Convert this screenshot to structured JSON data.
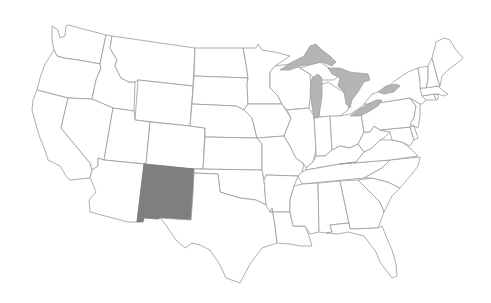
{
  "map": {
    "title": "United States",
    "highlighted_state": "New Mexico",
    "colors": {
      "background": "#ffffff",
      "state_fill": "#ffffff",
      "state_border": "#9a9a9a",
      "highlight_fill": "#7f7f7f",
      "lake_fill": "#b5b5b5"
    },
    "states": [
      {
        "name": "Washington",
        "highlighted": false
      },
      {
        "name": "Oregon",
        "highlighted": false
      },
      {
        "name": "California",
        "highlighted": false
      },
      {
        "name": "Idaho",
        "highlighted": false
      },
      {
        "name": "Nevada",
        "highlighted": false
      },
      {
        "name": "Montana",
        "highlighted": false
      },
      {
        "name": "Wyoming",
        "highlighted": false
      },
      {
        "name": "Utah",
        "highlighted": false
      },
      {
        "name": "Arizona",
        "highlighted": false
      },
      {
        "name": "Colorado",
        "highlighted": false
      },
      {
        "name": "New Mexico",
        "highlighted": true
      },
      {
        "name": "North Dakota",
        "highlighted": false
      },
      {
        "name": "South Dakota",
        "highlighted": false
      },
      {
        "name": "Nebraska",
        "highlighted": false
      },
      {
        "name": "Kansas",
        "highlighted": false
      },
      {
        "name": "Oklahoma",
        "highlighted": false
      },
      {
        "name": "Texas",
        "highlighted": false
      },
      {
        "name": "Minnesota",
        "highlighted": false
      },
      {
        "name": "Iowa",
        "highlighted": false
      },
      {
        "name": "Missouri",
        "highlighted": false
      },
      {
        "name": "Arkansas",
        "highlighted": false
      },
      {
        "name": "Louisiana",
        "highlighted": false
      },
      {
        "name": "Wisconsin",
        "highlighted": false
      },
      {
        "name": "Illinois",
        "highlighted": false
      },
      {
        "name": "Michigan",
        "highlighted": false
      },
      {
        "name": "Indiana",
        "highlighted": false
      },
      {
        "name": "Ohio",
        "highlighted": false
      },
      {
        "name": "Kentucky",
        "highlighted": false
      },
      {
        "name": "Tennessee",
        "highlighted": false
      },
      {
        "name": "Mississippi",
        "highlighted": false
      },
      {
        "name": "Alabama",
        "highlighted": false
      },
      {
        "name": "Georgia",
        "highlighted": false
      },
      {
        "name": "Florida",
        "highlighted": false
      },
      {
        "name": "South Carolina",
        "highlighted": false
      },
      {
        "name": "North Carolina",
        "highlighted": false
      },
      {
        "name": "Virginia",
        "highlighted": false
      },
      {
        "name": "West Virginia",
        "highlighted": false
      },
      {
        "name": "Maryland",
        "highlighted": false
      },
      {
        "name": "Delaware",
        "highlighted": false
      },
      {
        "name": "Pennsylvania",
        "highlighted": false
      },
      {
        "name": "New Jersey",
        "highlighted": false
      },
      {
        "name": "New York",
        "highlighted": false
      },
      {
        "name": "Connecticut",
        "highlighted": false
      },
      {
        "name": "Rhode Island",
        "highlighted": false
      },
      {
        "name": "Massachusetts",
        "highlighted": false
      },
      {
        "name": "Vermont",
        "highlighted": false
      },
      {
        "name": "New Hampshire",
        "highlighted": false
      },
      {
        "name": "Maine",
        "highlighted": false
      }
    ],
    "lakes": [
      "Lake Superior",
      "Lake Michigan",
      "Lake Huron",
      "Lake Erie",
      "Lake Ontario"
    ]
  }
}
